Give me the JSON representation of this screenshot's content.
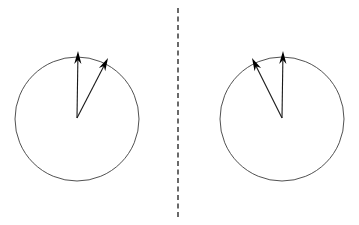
{
  "figure": {
    "background_color": "#ffffff",
    "width": 359,
    "height": 225
  },
  "style": {
    "circle_stroke_color": "#3d3d3d",
    "circle_stroke_width": 0.9,
    "vector_stroke_color": "#1a1a1a",
    "vector_stroke_width": 1.1,
    "arrow_head_color": "#000000",
    "divider_color": "#2b2b2b",
    "divider_stroke_width": 1.4,
    "divider_dash_pattern": "5,3.5"
  },
  "panels": [
    {
      "id": "left-panel",
      "label": "Left circle panel",
      "circle": {
        "center_x": 77,
        "center_y": 119,
        "radius": 62
      },
      "vectors": [
        {
          "id": "left-vertical-vector",
          "label": "Vertical vector",
          "origin_x": 77,
          "origin_y": 118,
          "tip_x": 78,
          "tip_y": 51,
          "angle_deg": 90,
          "length": 67,
          "head_length": 13,
          "head_half_width": 3.6
        },
        {
          "id": "left-tilted-vector",
          "label": "Tilted vector (right of vertical)",
          "origin_x": 77,
          "origin_y": 118,
          "tip_x": 108,
          "tip_y": 58,
          "angle_deg": 62.7,
          "length": 67.5,
          "head_length": 13,
          "head_half_width": 3.6
        }
      ]
    },
    {
      "id": "right-panel",
      "label": "Right circle panel",
      "circle": {
        "center_x": 282,
        "center_y": 119,
        "radius": 62
      },
      "vectors": [
        {
          "id": "right-vertical-vector",
          "label": "Vertical vector",
          "origin_x": 282,
          "origin_y": 118,
          "tip_x": 283,
          "tip_y": 51,
          "angle_deg": 90,
          "length": 67,
          "head_length": 13,
          "head_half_width": 3.6
        },
        {
          "id": "right-tilted-vector",
          "label": "Tilted vector (left of vertical)",
          "origin_x": 282,
          "origin_y": 118,
          "tip_x": 252,
          "tip_y": 58,
          "angle_deg": 117.3,
          "length": 67.5,
          "head_length": 13,
          "head_half_width": 3.6
        }
      ]
    }
  ],
  "divider": {
    "id": "panel-divider",
    "label": "Vertical dashed divider",
    "x": 178,
    "y_start": 8,
    "y_end": 218
  },
  "labels": {
    "annotations": [],
    "axis_ticks": [],
    "legend": []
  }
}
